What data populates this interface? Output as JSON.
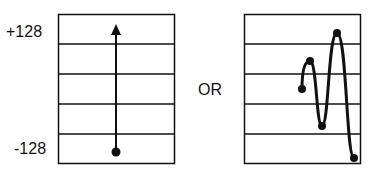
{
  "left_panel": {
    "top_label": "+128",
    "bottom_label": "-128",
    "description": "Single upward arrow from bottom dot to top"
  },
  "connector_label": "OR",
  "right_panel": {
    "description": "Oscillating curve through dotted points"
  },
  "colors": {
    "line": "#111111",
    "background": "#ffffff"
  }
}
